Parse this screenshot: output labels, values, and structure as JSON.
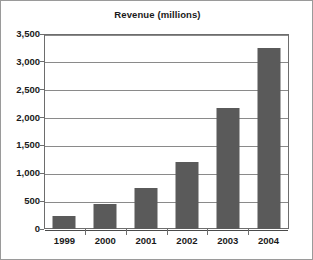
{
  "chart_data": {
    "type": "bar",
    "title": "Revenue (millions)",
    "xlabel": "",
    "ylabel": "",
    "categories": [
      "1999",
      "2000",
      "2001",
      "2002",
      "2003",
      "2004"
    ],
    "values": [
      233,
      450,
      740,
      1210,
      2170,
      3250
    ],
    "series": [
      {
        "name": "Revenue",
        "values": [
          233,
          450,
          740,
          1210,
          2170,
          3250
        ]
      }
    ],
    "ylim": [
      0,
      3500
    ],
    "ytick_values": [
      0,
      500,
      1000,
      1500,
      2000,
      2500,
      3000,
      3500
    ],
    "ytick_labels": [
      "0",
      "500",
      "1,000",
      "1,500",
      "2,000",
      "2,500",
      "3,000",
      "3,500"
    ],
    "xtick_labels": [
      "1999",
      "2000",
      "2001",
      "2002",
      "2003",
      "2004"
    ],
    "grid": true,
    "grid_axis": "y",
    "legend": false,
    "legend_position": "none",
    "colors": {
      "bar": "#5a5a5a",
      "gridline": "#8a8a8a",
      "axis": "#6d6d6d",
      "frame": "#9a9a9a",
      "background": "#ffffff",
      "text": "#1a1a1a"
    }
  }
}
